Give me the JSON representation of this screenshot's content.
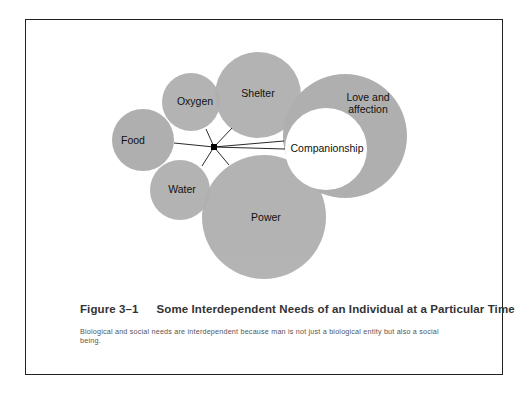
{
  "diagram": {
    "hub": {
      "x": 214,
      "y": 147
    },
    "circles": [
      {
        "id": "food",
        "label": "Food",
        "cx": 143,
        "cy": 140,
        "r": 31,
        "fill": "#aaaaaa"
      },
      {
        "id": "oxygen",
        "label": "Oxygen",
        "cx": 191,
        "cy": 102,
        "r": 29,
        "fill": "#aaaaaa"
      },
      {
        "id": "shelter",
        "label": "Shelter",
        "cx": 258,
        "cy": 95,
        "r": 43,
        "fill": "#aaaaaa"
      },
      {
        "id": "water",
        "label": "Water",
        "cx": 180,
        "cy": 190,
        "r": 30,
        "fill": "#aaaaaa"
      },
      {
        "id": "power",
        "label": "Power",
        "cx": 264,
        "cy": 217,
        "r": 62,
        "fill": "#aaaaaa"
      },
      {
        "id": "love",
        "label_line1": "Love and",
        "label_line2": "affection",
        "cx": 345,
        "cy": 136,
        "r": 62,
        "fill": "#aaaaaa"
      },
      {
        "id": "companionship",
        "label": "Companionship",
        "cx": 326,
        "cy": 149,
        "r": 41,
        "fill": "#ffffff"
      }
    ]
  },
  "caption": {
    "figure_number": "Figure 3–1",
    "title": "Some Interdependent Needs of an Individual at a Particular Time",
    "body": "Biological and social needs are interdependent because man is not just a biological entity but also a social being."
  }
}
